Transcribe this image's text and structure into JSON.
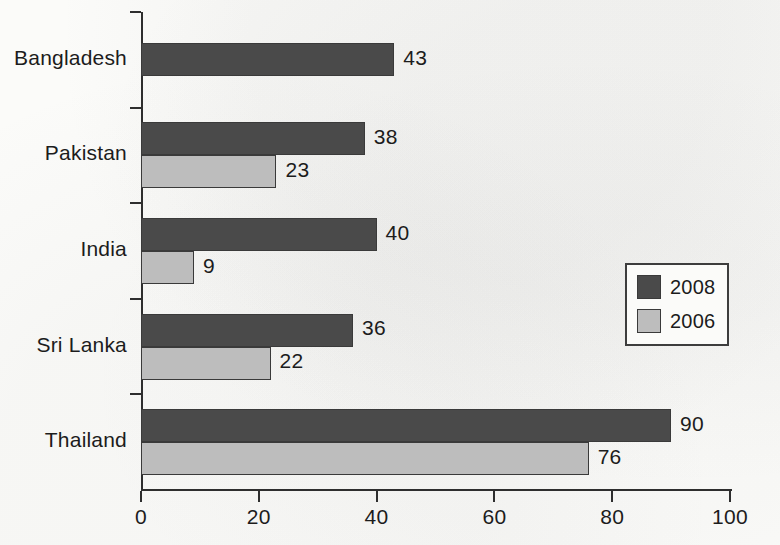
{
  "chart_data": {
    "type": "bar",
    "orientation": "horizontal",
    "title": "",
    "xlabel": "",
    "ylabel": "",
    "xlim": [
      0,
      100
    ],
    "xticks": [
      0,
      20,
      40,
      60,
      80,
      100
    ],
    "xtick_labels": [
      "0",
      "20",
      "40",
      "60",
      "80",
      "100"
    ],
    "grid": false,
    "legend_position": "right-center",
    "categories": [
      "Bangladesh",
      "Pakistan",
      "India",
      "Sri Lanka",
      "Thailand"
    ],
    "series": [
      {
        "name": "2008",
        "color": "#4a4a4a",
        "values": [
          43,
          38,
          40,
          36,
          90
        ],
        "value_labels": [
          "43",
          "38",
          "40",
          "36",
          "90"
        ]
      },
      {
        "name": "2006",
        "color": "#bdbdbd",
        "values": [
          null,
          23,
          9,
          22,
          76
        ],
        "value_labels": [
          "",
          "23",
          "9",
          "22",
          "76"
        ]
      }
    ]
  },
  "legend": {
    "entries": [
      {
        "label": "2008",
        "color": "#4a4a4a"
      },
      {
        "label": "2006",
        "color": "#bdbdbd"
      }
    ]
  },
  "axis": {
    "x_tick_labels": [
      "0",
      "20",
      "40",
      "60",
      "80",
      "100"
    ],
    "y_tick_labels": [
      "Bangladesh",
      "Pakistan",
      "India",
      "Sri Lanka",
      "Thailand"
    ]
  },
  "colors": {
    "series_2008": "#4a4a4a",
    "series_2006": "#bdbdbd",
    "axis": "#2e2e2e",
    "text": "#1c1c1c",
    "background": "#fbfbf9"
  }
}
